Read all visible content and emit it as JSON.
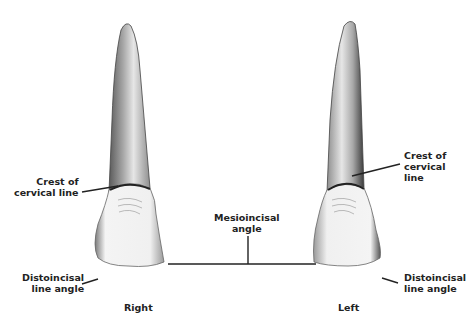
{
  "figure": {
    "type": "dental-anatomy-illustration",
    "labels": {
      "crest_left": [
        "Crest of",
        "cervical line"
      ],
      "crest_right": [
        "Crest of",
        "cervical",
        "line"
      ],
      "distoincisal_left": [
        "Distoincisal",
        "line angle"
      ],
      "distoincisal_right": [
        "Distoincisal",
        "line angle"
      ],
      "mesioincisal": [
        "Mesioincisal",
        "angle"
      ],
      "side_right": "Right",
      "side_left": "Left"
    },
    "colors": {
      "background": "#ffffff",
      "ink": "#222222",
      "enamel": "#f2f2f2",
      "root_shade": "#8a8a8a"
    }
  }
}
